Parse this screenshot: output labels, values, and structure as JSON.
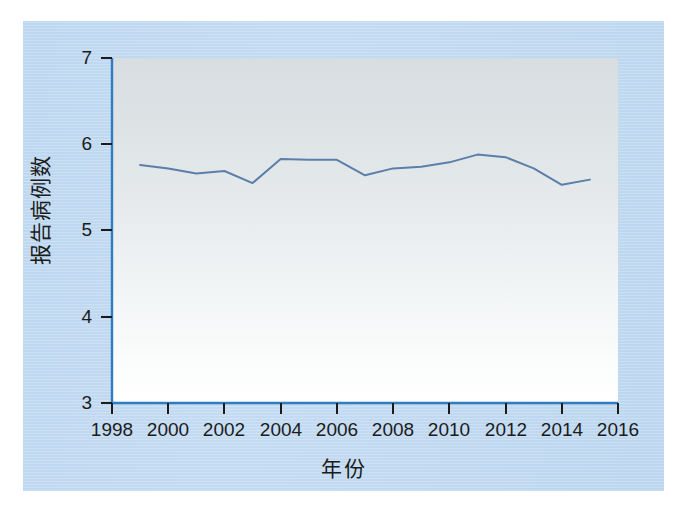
{
  "chart_data": {
    "type": "line",
    "title": "",
    "xlabel": "年份",
    "ylabel": "报告病例数",
    "xlim": [
      1998,
      2016
    ],
    "ylim": [
      3,
      7
    ],
    "grid": false,
    "legend": null,
    "x_ticks": [
      "1998",
      "2000",
      "2002",
      "2004",
      "2006",
      "2008",
      "2010",
      "2012",
      "2014",
      "2016"
    ],
    "x_tick_values": [
      1998,
      2000,
      2002,
      2004,
      2006,
      2008,
      2010,
      2012,
      2014,
      2016
    ],
    "y_ticks": [
      "3",
      "4",
      "5",
      "6",
      "7"
    ],
    "y_tick_values": [
      3,
      4,
      5,
      6,
      7
    ],
    "x": [
      1999,
      2000,
      2001,
      2002,
      2003,
      2004,
      2005,
      2006,
      2007,
      2008,
      2009,
      2010,
      2011,
      2012,
      2013,
      2014,
      2015
    ],
    "values": [
      5.76,
      5.72,
      5.66,
      5.69,
      5.55,
      5.83,
      5.82,
      5.82,
      5.64,
      5.72,
      5.74,
      5.79,
      5.88,
      5.85,
      5.72,
      5.53,
      5.59
    ],
    "series": [
      {
        "name": "报告病例数",
        "color": "#5a7fa8",
        "line_width": 2,
        "markers": false,
        "values": [
          5.76,
          5.72,
          5.66,
          5.69,
          5.55,
          5.83,
          5.82,
          5.82,
          5.64,
          5.72,
          5.74,
          5.79,
          5.88,
          5.85,
          5.72,
          5.53,
          5.59
        ]
      }
    ]
  },
  "colors": {
    "page_background": "#c0d8f0",
    "panel_top": "#d7dde0",
    "panel_bottom": "#ffffff",
    "axis": "#2f7cc0",
    "line": "#5a7fa8",
    "text": "#1b1b1b"
  },
  "axis": {
    "x_label": "年份",
    "y_label": "报告病例数",
    "x_tick_labels": [
      "1998",
      "2000",
      "2002",
      "2004",
      "2006",
      "2008",
      "2010",
      "2012",
      "2014",
      "2016"
    ],
    "y_tick_labels": [
      "7",
      "6",
      "5",
      "4",
      "3"
    ]
  }
}
